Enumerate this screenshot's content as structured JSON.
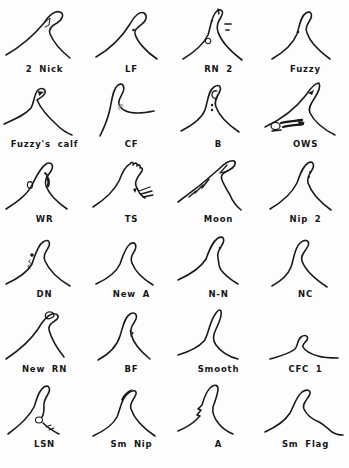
{
  "page": {
    "background": "#fdfdfd",
    "ink_color": "#1a1a1a"
  },
  "catalog": {
    "rows": 6,
    "columns": 4,
    "cells": [
      {
        "id": "2-nick",
        "label": "2 Nick",
        "paths": [
          {
            "d": "M5,51 C19,43 33,31 43,19 C47,12 54,6 59,8 C64,10 61,16 56,19 C50,22 47,25 49,30 C52,37 59,46 69,54"
          },
          {
            "d": "M43,19 L49,14 L48,21 L44,23",
            "w": 1.0
          }
        ]
      },
      {
        "id": "lf",
        "label": "LF",
        "paths": [
          {
            "d": "M8,53 C22,45 34,33 42,20 C46,12 52,7 56,9 C60,12 58,17 54,20 C49,24 46,26 47,30 C49,37 57,47 69,55"
          },
          {
            "d": "M44.2,26 a1.3,1.3 0 1,0 2.6,0 a1.3,1.3 0 1,0 -2.6,0",
            "f": "#1a1a1a"
          }
        ]
      },
      {
        "id": "rn-2",
        "label": "RN 2",
        "paths": [
          {
            "d": "M8,55 C18,49 28,41 33,31 C36,22 36,12 42,7 C47,4 49,8 46,13 C43,18 41,22 43,28 C46,37 55,47 67,56"
          },
          {
            "d": "M43,5 L44,10",
            "w": 1.4
          },
          {
            "d": "M35.8,17 a1.1,1.1 0 1,0 2.2,0 a1.1,1.1 0 1,0 -2.2,0",
            "f": "#1a1a1a"
          },
          {
            "d": "M50,20 L56,20",
            "w": 1.7
          },
          {
            "d": "M51,26 L54,26",
            "w": 1.7
          },
          {
            "d": "M30.4,37 a2.7,2.7 0 1,0 5.4,0 a2.7,2.7 0 1,0 -5.4,0",
            "w": 1.1
          }
        ]
      },
      {
        "id": "fuzzy",
        "label": "Fuzzy",
        "paths": [
          {
            "d": "M10,55 C22,48 31,40 35,30 C38,21 38,13 44,9 C49,6 51,11 48,16 C45,21 43,24 45,29 C48,38 57,47 68,55"
          },
          {
            "d": "M34.7,28 a1.3,1.3 0 1,0 2.6,0 a1.3,1.3 0 1,0 -2.6,0",
            "f": "#1a1a1a"
          }
        ]
      },
      {
        "id": "fuzzys-calf",
        "label": "Fuzzy's calf",
        "paths": [
          {
            "d": "M3,45 C14,40 24,36 30,29 C33,24 33,15 37,11 C41,8 45,10 44,14 C43,17 39,19 36,21 C39,28 47,38 57,47 C61,51 66,54 71,56"
          },
          {
            "d": "M37,12 L43,13 L38,17 Z",
            "f": "#1a1a1a"
          }
        ]
      },
      {
        "id": "cf",
        "label": "CF",
        "paths": [
          {
            "d": "M12,57 C17,47 20,39 22,30 C24,20 25,10 30,6 C35,3 37,8 35,13 C33,18 30,21 31,25 C33,31 40,34 50,34 C56,34 61,33 66,32"
          },
          {
            "d": "M30,27 q3,-3 5,-1 q-1,3 -4,2 q-2,2 1,3",
            "s": "#8a8a8a",
            "w": 0.9
          }
        ]
      },
      {
        "id": "b",
        "label": "B",
        "paths": [
          {
            "d": "M6,52 C16,47 26,41 30,31 C33,22 33,12 39,8 C45,4 47,9 44,14 C41,19 39,23 41,28 C44,36 52,45 64,53"
          },
          {
            "d": "M42,12 C39,11 37,13 37,16 C37,19 40,20 42,19",
            "w": 1.3
          },
          {
            "d": "M35.8,26 a1.2,1.2 0 1,0 2.4,0 a1.2,1.2 0 1,0 -2.4,0",
            "f": "#1a1a1a"
          },
          {
            "d": "M35.8,31 a1.2,1.2 0 1,0 2.4,0 a1.2,1.2 0 1,0 -2.4,0",
            "f": "#1a1a1a"
          }
        ]
      },
      {
        "id": "ows",
        "label": "OWS",
        "paths": [
          {
            "d": "M3,48 C18,41 34,29 44,16 C48,10 53,4 57,4 C59,8 56,14 52,20 C48,26 46,30 48,34 C52,42 61,50 73,56"
          },
          {
            "d": "M46,14 L52,11 L50,16 Z",
            "f": "#1a1a1a"
          },
          {
            "d": "M9,47 a4.5,3.6 0 1,0 9,0 a4.5,3.6 0 1,0 -9,0",
            "w": 1.2
          },
          {
            "d": "M19,44 C26,42 33,42 40,41",
            "w": 2.3
          },
          {
            "d": "M21,48 C28,46 35,46 41,45",
            "w": 2.3
          },
          {
            "d": "M36,42 L43,43 L37,47 Z",
            "f": "#1a1a1a"
          },
          {
            "d": "M10,52 L19,51",
            "w": 1.6
          }
        ]
      },
      {
        "id": "wr",
        "label": "WR",
        "paths": [
          {
            "d": "M5,55 C16,48 26,41 31,31 C35,23 39,14 45,10 C51,7 53,12 50,17 C46,23 43,26 45,32 C48,40 56,48 66,55"
          },
          {
            "d": "M26.4,31 a2.6,3.4 0 1,0 5.2,0 a2.6,3.4 0 1,0 -5.2,0",
            "w": 1.1
          },
          {
            "d": "M46,23 C48,26 48,29 47,32",
            "w": 2.6
          },
          {
            "d": "M44,19 L46,21",
            "w": 1.8
          }
        ]
      },
      {
        "id": "ts",
        "label": "TS",
        "paths": [
          {
            "d": "M5,53 C16,46 26,37 31,27 C34,19 37,12 42,10 C44,7 46,9 45,11 C47,8 50,9 49,12 C51,10 53,11 52,14 C54,13 55,15 54,17 C52,20 49,23 48,27 C47,30 48,33 50,36 C51,39 54,42 57,44"
          },
          {
            "d": "M51,37 L62,33",
            "w": 1.3
          },
          {
            "d": "M53,40 L64,37",
            "w": 1.3
          },
          {
            "d": "M55,43 L65,41",
            "w": 1.3
          },
          {
            "d": "M45,35 L49,34 L47,39 Z",
            "f": "#1a1a1a"
          }
        ]
      },
      {
        "id": "moon",
        "label": "Moon",
        "paths": [
          {
            "d": "M3,48 C17,38 33,25 44,15 C49,10 55,6 59,7 C62,9 59,14 54,16 C48,19 45,21 47,26 C49,31 52,36 55,41 C57,46 60,51 66,56"
          },
          {
            "d": "M52,11 L45,19 L53,17",
            "w": 1.2
          },
          {
            "d": "M14,43 L21,37",
            "w": 1.5
          },
          {
            "d": "M20,39 L28,31",
            "w": 1.5
          },
          {
            "d": "M27,34 L34,25",
            "w": 1.5
          }
        ]
      },
      {
        "id": "nip-2",
        "label": "Nip 2",
        "paths": [
          {
            "d": "M8,55 C20,48 30,39 35,29 C38,21 40,13 46,9 C51,6 53,11 50,16 C47,21 45,24 46,29 C49,38 58,48 69,56"
          },
          {
            "d": "M47.1,18 a1.1,1.1 0 1,0 2.2,0 a1.1,1.1 0 1,0 -2.2,0",
            "f": "#1a1a1a"
          },
          {
            "d": "M45.9,23 a1.1,1.1 0 1,0 2.2,0 a1.1,1.1 0 1,0 -2.2,0",
            "f": "#1a1a1a"
          }
        ]
      },
      {
        "id": "dn",
        "label": "DN",
        "paths": [
          {
            "d": "M5,55 C16,50 26,44 31,35 C34,27 36,17 42,13 C48,9 50,14 47,19 C44,24 42,27 44,32 C48,41 57,50 69,57"
          },
          {
            "d": "M29.2,26 a1.8,1.8 0 1,0 3.6,0 a1.8,1.8 0 1,0 -3.6,0",
            "f": "#1a1a1a"
          },
          {
            "d": "M29,31 c-2,1 -1,3 1,3",
            "w": 1.0
          },
          {
            "d": "M28,36 c-2,1 -1,3 1,3",
            "w": 1.0
          }
        ]
      },
      {
        "id": "new-a",
        "label": "New A",
        "paths": [
          {
            "d": "M8,55 C19,50 28,44 32,35 C35,27 37,19 42,15 C47,12 49,16 47,21 C44,26 42,29 44,34 C47,42 55,50 65,56"
          }
        ]
      },
      {
        "id": "n-n",
        "label": "N-N",
        "paths": [
          {
            "d": "M3,51 C14,46 25,40 31,30 C34,22 37,13 43,9 C49,6 50,11 47,16 C44,21 42,24 43,29 C44,33 43,37 46,41 C50,46 56,51 63,55"
          },
          {
            "d": "M43.7,19 a1.3,1.3 0 1,0 2.6,0 a1.3,1.3 0 1,0 -2.6,0",
            "f": "#1a1a1a"
          }
        ]
      },
      {
        "id": "nc",
        "label": "NC",
        "paths": [
          {
            "d": "M10,57 C19,52 26,46 29,38 C32,30 32,20 38,14 C44,9 48,12 46,17 C43,23 38,26 40,32 C43,41 53,50 65,58"
          }
        ]
      },
      {
        "id": "new-rn",
        "label": "New RN",
        "paths": [
          {
            "d": "M5,55 C17,47 29,37 37,25 C41,18 45,12 51,10 C57,9 59,13 55,16 C51,19 47,21 48,26 C50,33 55,43 63,53"
          },
          {
            "d": "M45,14 C43,10 46,7 50,8 C54,9 54,13 50,14 C48,15 46,15 45,14",
            "w": 1.2
          }
        ]
      },
      {
        "id": "bf",
        "label": "BF",
        "paths": [
          {
            "d": "M10,56 C21,50 29,42 32,32 C35,23 36,14 42,10 C48,7 50,12 47,17 C44,22 42,25 43,30 C45,38 52,47 62,55"
          },
          {
            "d": "M42,27 l3,2 l-2,3",
            "w": 1.2
          }
        ]
      },
      {
        "id": "smooth",
        "label": "Smooth",
        "paths": [
          {
            "d": "M3,51 C13,48 23,44 29,37 C34,30 34,18 41,9 C43,6 45,5 46,7 C47,11 44,19 41,25 C38,31 37,36 41,41 C46,48 55,53 63,55"
          }
        ]
      },
      {
        "id": "cfc-1",
        "label": "CFC 1",
        "paths": [
          {
            "d": "M8,55 C18,52 27,50 33,45 C36,42 35,36 39,33 C43,30 47,32 45,36 C43,39 40,40 41,43 C43,47 49,50 56,52 C62,54 69,54 76,54"
          }
        ]
      },
      {
        "id": "lsn",
        "label": "LSN",
        "paths": [
          {
            "d": "M7,55 C18,47 28,38 33,28 C36,20 37,12 43,8 C48,5 50,10 47,15 C44,20 42,24 43,28 C43,32 43,35 41,38"
          },
          {
            "d": "M34.5,41 a3.5,3 0 1,0 7,0 a3.5,3 0 1,0 -7,0",
            "w": 1.1
          },
          {
            "d": "M42,44 C46,48 52,52 58,55"
          },
          {
            "d": "M45,48 l5,-2",
            "w": 1.1
          },
          {
            "d": "M48,51 l5,-2",
            "w": 1.1
          }
        ]
      },
      {
        "id": "sm-nip",
        "label": "Sm Nip",
        "paths": [
          {
            "d": "M5,57 C16,52 25,46 29,38 C32,31 33,22 38,16 C43,11 49,10 48,15 C46,21 41,24 43,30 C46,39 55,49 67,57"
          },
          {
            "d": "M33,21 C35,16 38,13 42,11 L45,10 C41,14 37,18 35,22 Z",
            "f": "#1a1a1a"
          }
        ]
      },
      {
        "id": "a",
        "label": "A",
        "paths": [
          {
            "d": "M3,52 C10,49 16,46 21,41 L25,37 L22,36 L26,31 L23,30 L27,26 C29,19 31,12 36,8 C40,5 43,6 43,10 C43,15 40,22 38,28 C37,33 39,39 44,45 C48,50 53,53 58,55"
          }
        ]
      },
      {
        "id": "sm-flag",
        "label": "Sm Flag",
        "paths": [
          {
            "d": "M3,53 C14,48 23,42 28,34 C32,27 34,18 40,13 C46,9 50,12 47,17 C44,22 40,25 42,30 C45,37 52,41 57,43 C61,45 65,49 70,53 C73,55 77,56 81,56"
          }
        ]
      }
    ]
  }
}
